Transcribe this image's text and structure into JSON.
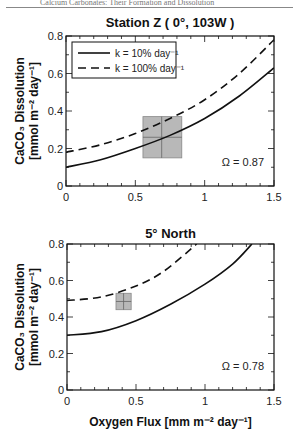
{
  "page": {
    "running_header": "Calcium Carbonates: Their Formation and Dissolution"
  },
  "chart_data": [
    {
      "type": "line",
      "title": "Station Z  ( 0°, 103W )",
      "xlabel": "",
      "ylabel_line1": "CaCO₃ Dissolution",
      "ylabel_line2": "[mmol m⁻² day⁻¹]",
      "xlim": [
        0,
        1.5
      ],
      "ylim": [
        0,
        0.8
      ],
      "x_ticks": [
        0,
        0.5,
        1,
        1.5
      ],
      "x_tick_labels": [
        "0",
        "0.5",
        "1",
        "1.5"
      ],
      "y_ticks": [
        0,
        0.2,
        0.4,
        0.6,
        0.8
      ],
      "y_tick_labels": [
        "0",
        "0.2",
        "0.4",
        "0.6",
        "0.8"
      ],
      "grid": false,
      "legend": {
        "placement": "top-left",
        "entries": [
          {
            "label": "k = 10% day⁻¹",
            "style": "solid"
          },
          {
            "label": "k = 100% day⁻¹",
            "style": "dashed"
          }
        ]
      },
      "annotation": "Ω  = 0.87",
      "series": [
        {
          "name": "k = 10% day-1",
          "style": "solid",
          "x": [
            0,
            0.25,
            0.5,
            0.75,
            1.0,
            1.25,
            1.5
          ],
          "y": [
            0.1,
            0.14,
            0.2,
            0.27,
            0.36,
            0.48,
            0.63
          ]
        },
        {
          "name": "k = 100% day-1",
          "style": "dashed",
          "x": [
            0,
            0.25,
            0.5,
            0.75,
            1.0,
            1.25,
            1.5
          ],
          "y": [
            0.18,
            0.22,
            0.28,
            0.36,
            0.46,
            0.6,
            0.78
          ]
        }
      ],
      "observation": {
        "x": 0.69,
        "y": 0.26,
        "x_range": [
          0.555,
          0.835
        ],
        "y_range": [
          0.15,
          0.37
        ],
        "color": "#b8b8b8"
      }
    },
    {
      "type": "line",
      "title": "5° North",
      "xlabel": "Oxygen Flux [mm m⁻² day⁻¹]",
      "ylabel_line1": "CaCO₃ Dissolution",
      "ylabel_line2": "[mmol m⁻² day⁻¹]",
      "xlim": [
        0,
        1.5
      ],
      "ylim": [
        0,
        0.8
      ],
      "x_ticks": [
        0,
        0.5,
        1,
        1.5
      ],
      "x_tick_labels": [
        "0",
        "0.5",
        "1",
        "1.5"
      ],
      "y_ticks": [
        0,
        0.2,
        0.4,
        0.6,
        0.8
      ],
      "y_tick_labels": [
        "0",
        "0.2",
        "0.4",
        "0.6",
        "0.8"
      ],
      "grid": false,
      "annotation": "Ω  = 0.78",
      "series": [
        {
          "name": "k = 10% day-1",
          "style": "solid",
          "x": [
            0,
            0.25,
            0.5,
            0.75,
            1.0,
            1.2,
            1.34
          ],
          "y": [
            0.3,
            0.32,
            0.38,
            0.47,
            0.58,
            0.69,
            0.8
          ]
        },
        {
          "name": "k = 100% day-1",
          "style": "dashed",
          "x": [
            0,
            0.25,
            0.5,
            0.7,
            0.94
          ],
          "y": [
            0.49,
            0.51,
            0.57,
            0.65,
            0.8
          ]
        }
      ],
      "observation": {
        "x": 0.41,
        "y": 0.485,
        "x_range": [
          0.355,
          0.465
        ],
        "y_range": [
          0.44,
          0.53
        ],
        "color": "#b8b8b8"
      }
    }
  ]
}
